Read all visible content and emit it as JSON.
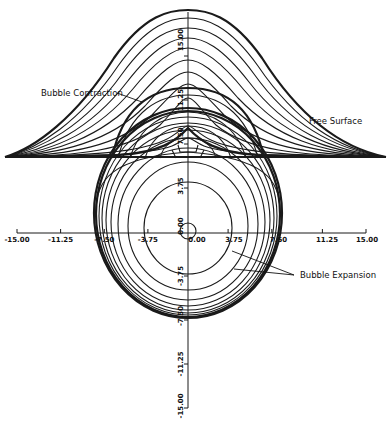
{
  "figure": {
    "annotations": {
      "contraction": "Bubble Contraction",
      "free_surface": "Free Surface",
      "expansion": "Bubble Expansion"
    },
    "x_axis": {
      "ticks": [
        "-15.00",
        "-11.25",
        "-7.50",
        "-3.75",
        "0.00",
        "3.75",
        "7.50",
        "11.25",
        "15.00"
      ]
    },
    "y_axis": {
      "ticks_upper": [
        "15.00",
        "11.25",
        "7.50",
        "3.75",
        "0.00"
      ],
      "ticks_lower": [
        "-3.75",
        "-7.50",
        "-11.25",
        "-15.00"
      ]
    }
  }
}
